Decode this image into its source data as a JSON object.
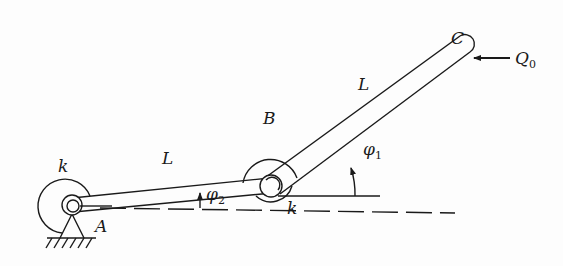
{
  "diagram": {
    "type": "mechanics-two-bar-linkage",
    "nodes": {
      "A": {
        "label": "A",
        "kind": "pinned-support-with-torsional-spring"
      },
      "B": {
        "label": "B",
        "kind": "hinge-with-torsional-spring"
      },
      "C": {
        "label": "C",
        "kind": "free-end"
      }
    },
    "members": [
      {
        "from": "A",
        "to": "B",
        "length_label": "L"
      },
      {
        "from": "B",
        "to": "C",
        "length_label": "L"
      }
    ],
    "springs": [
      {
        "at": "A",
        "label": "k"
      },
      {
        "at": "B",
        "label": "k"
      }
    ],
    "angles": [
      {
        "label": "φ",
        "subscript": "1",
        "desc": "angle of BC from horizontal at B"
      },
      {
        "label": "φ",
        "subscript": "2",
        "desc": "angle of AB from horizontal at A"
      }
    ],
    "load": {
      "label": "Q",
      "subscript": "0",
      "at": "C",
      "direction": "left"
    }
  },
  "labels": {
    "k_A": "k",
    "k_B": "k",
    "L_AB": "L",
    "L_BC": "L",
    "A": "A",
    "B": "B",
    "C": "C",
    "phi": "φ",
    "phi1_sub": "1",
    "phi2_sub": "2",
    "Q": "Q",
    "Q_sub": "0"
  },
  "colors": {
    "ink": "#1a1a1a",
    "background": "#fdfdfd"
  }
}
